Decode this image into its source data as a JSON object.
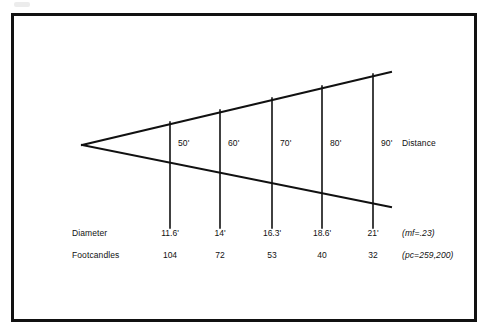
{
  "figure": {
    "line_color": "#111111",
    "background_color": "#ffffff",
    "border_color": "#111111"
  },
  "axis_labels": {
    "distance": "Distance",
    "diameter": "Diameter",
    "footcandles": "Footcandles"
  },
  "notes": {
    "mf": "(mf=.23)",
    "pc": "(pc=259,200)"
  },
  "chart_data": {
    "type": "diagram",
    "categories": [
      "50'",
      "60'",
      "70'",
      "80'",
      "90'"
    ],
    "series": [
      {
        "name": "Distance",
        "values": [
          "50'",
          "60'",
          "70'",
          "80'",
          "90'"
        ]
      },
      {
        "name": "Diameter",
        "values": [
          "11.6'",
          "14'",
          "16.3'",
          "18.6'",
          "21'"
        ]
      },
      {
        "name": "Footcandles",
        "values": [
          "104",
          "72",
          "53",
          "40",
          "32"
        ]
      }
    ],
    "annotations": [
      "(mf=.23)",
      "(pc=259,200)"
    ],
    "xlabel": "",
    "ylabel": "",
    "grid": false,
    "legend": "none"
  },
  "stations": [
    {
      "distance": "50'",
      "diameter": "11.6'",
      "footcandles": "104",
      "x": 170,
      "top_y": 122,
      "bottom_y": 228
    },
    {
      "distance": "60'",
      "diameter": "14'",
      "footcandles": "72",
      "x": 220,
      "top_y": 110,
      "bottom_y": 228
    },
    {
      "distance": "70'",
      "diameter": "16.3'",
      "footcandles": "53",
      "x": 272,
      "top_y": 98,
      "bottom_y": 228
    },
    {
      "distance": "80'",
      "diameter": "18.6'",
      "footcandles": "40",
      "x": 322,
      "top_y": 86,
      "bottom_y": 228
    },
    {
      "distance": "90'",
      "diameter": "21'",
      "footcandles": "32",
      "x": 373,
      "top_y": 74,
      "bottom_y": 228
    }
  ],
  "cone": {
    "apex_x": 82,
    "apex_y": 145,
    "upper_end_x": 391,
    "upper_end_y": 72,
    "lower_end_x": 391,
    "lower_end_y": 207
  }
}
